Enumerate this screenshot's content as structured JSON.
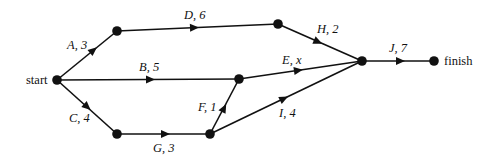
{
  "diagram": {
    "type": "activity-network",
    "terminals": {
      "start": "start",
      "finish": "finish"
    },
    "nodes": [
      {
        "id": "start",
        "x": 57,
        "y": 80
      },
      {
        "id": "n1",
        "x": 117,
        "y": 31
      },
      {
        "id": "n2",
        "x": 278,
        "y": 24
      },
      {
        "id": "n3",
        "x": 239,
        "y": 79
      },
      {
        "id": "n4",
        "x": 117,
        "y": 134
      },
      {
        "id": "n5",
        "x": 210,
        "y": 134
      },
      {
        "id": "n6",
        "x": 362,
        "y": 61
      },
      {
        "id": "finish",
        "x": 434,
        "y": 61
      }
    ],
    "edges": [
      {
        "activity": "A",
        "duration": "3",
        "label": "A, 3",
        "from": "start",
        "to": "n1"
      },
      {
        "activity": "B",
        "duration": "5",
        "label": "B, 5",
        "from": "start",
        "to": "n3"
      },
      {
        "activity": "C",
        "duration": "4",
        "label": "C, 4",
        "from": "start",
        "to": "n4"
      },
      {
        "activity": "D",
        "duration": "6",
        "label": "D, 6",
        "from": "n1",
        "to": "n2"
      },
      {
        "activity": "E",
        "duration": "x",
        "label": "E, x",
        "from": "n3",
        "to": "n6"
      },
      {
        "activity": "F",
        "duration": "1",
        "label": "F, 1",
        "from": "n5",
        "to": "n3"
      },
      {
        "activity": "G",
        "duration": "3",
        "label": "G, 3",
        "from": "n4",
        "to": "n5"
      },
      {
        "activity": "H",
        "duration": "2",
        "label": "H, 2",
        "from": "n2",
        "to": "n6"
      },
      {
        "activity": "I",
        "duration": "4",
        "label": "I, 4",
        "from": "n5",
        "to": "n6"
      },
      {
        "activity": "J",
        "duration": "7",
        "label": "J, 7",
        "from": "n6",
        "to": "finish"
      }
    ]
  }
}
